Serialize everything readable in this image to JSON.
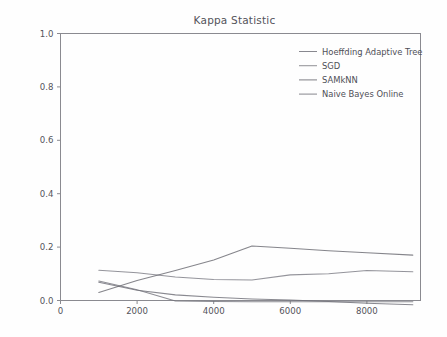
{
  "chart_data": {
    "type": "line",
    "title": "Kappa Statistic",
    "xlabel": "",
    "ylabel": "",
    "xlim": [
      0,
      9400
    ],
    "ylim": [
      0.0,
      1.0
    ],
    "grid": false,
    "legend_position": "upper right",
    "xticks": [
      "0",
      "2000",
      "4000",
      "6000",
      "8000"
    ],
    "xtick_values": [
      0,
      2000,
      4000,
      6000,
      8000
    ],
    "yticks": [
      "0.0",
      "0.2",
      "0.4",
      "0.6",
      "0.8",
      "1.0"
    ],
    "ytick_values": [
      0.0,
      0.2,
      0.4,
      0.6,
      0.8,
      1.0
    ],
    "x": [
      1000,
      2000,
      3000,
      4000,
      5000,
      6000,
      7000,
      8000,
      9200
    ],
    "series": [
      {
        "name": "Hoeffding Adaptive Tree",
        "color": "#6f6f77",
        "values": [
          0.068,
          0.038,
          0.021,
          0.012,
          0.006,
          0.002,
          -0.004,
          -0.01,
          -0.016
        ]
      },
      {
        "name": "SGD",
        "color": "#7d7d85",
        "values": [
          0.113,
          0.104,
          0.088,
          0.079,
          0.077,
          0.096,
          0.1,
          0.112,
          0.108
        ]
      },
      {
        "name": "SAMkNN",
        "color": "#6a6a72",
        "values": [
          0.03,
          0.075,
          0.112,
          0.152,
          0.204,
          0.196,
          0.186,
          0.179,
          0.17
        ]
      },
      {
        "name": "Naive Bayes Online",
        "color": "#74747c",
        "values": [
          0.073,
          0.04,
          -0.002,
          -0.004,
          -0.005,
          -0.005,
          -0.005,
          -0.005,
          -0.005
        ]
      }
    ]
  },
  "legend": {
    "entries": [
      "Hoeffding Adaptive Tree",
      "SGD",
      "SAMkNN",
      "Naive Bayes Online"
    ]
  }
}
